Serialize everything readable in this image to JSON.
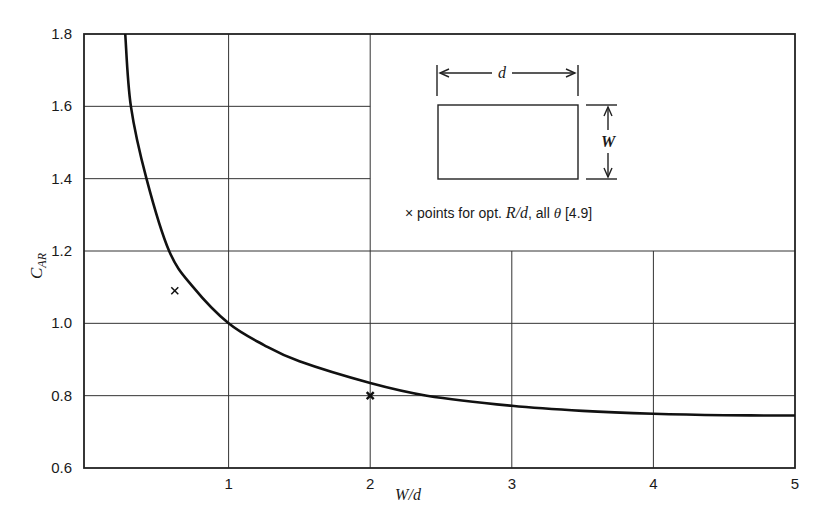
{
  "chart_data": {
    "type": "line",
    "title": "",
    "xlabel": "W/d",
    "ylabel": "C_AR",
    "xlim": [
      0,
      5
    ],
    "ylim": [
      0.6,
      1.8
    ],
    "grid": true,
    "x_ticks": [
      "1",
      "2",
      "3",
      "4",
      "5"
    ],
    "y_ticks": [
      "0.6",
      "0.8",
      "1.0",
      "1.2",
      "1.4",
      "1.6",
      "1.8"
    ],
    "series": [
      {
        "name": "C_AR curve",
        "x": [
          0.27,
          0.31,
          0.42,
          0.58,
          0.75,
          1.0,
          1.25,
          1.5,
          2.0,
          2.4,
          3.0,
          3.5,
          4.0,
          4.5,
          5.0
        ],
        "values": [
          1.8,
          1.6,
          1.4,
          1.2,
          1.1,
          1.0,
          0.94,
          0.895,
          0.835,
          0.8,
          0.772,
          0.758,
          0.75,
          0.746,
          0.745
        ]
      },
      {
        "name": "points for opt. R/d, all θ [4.9]",
        "marker": "x",
        "x": [
          0.62,
          2.0
        ],
        "values": [
          1.09,
          0.8
        ]
      }
    ],
    "annotations": {
      "inset_width_label": "d",
      "inset_height_label": "W",
      "legend_prefix": "×",
      "legend_text": "points for opt.",
      "legend_ratio": "R/d",
      "legend_all": ", all",
      "legend_theta": "θ",
      "legend_ref": "[4.9]"
    }
  }
}
